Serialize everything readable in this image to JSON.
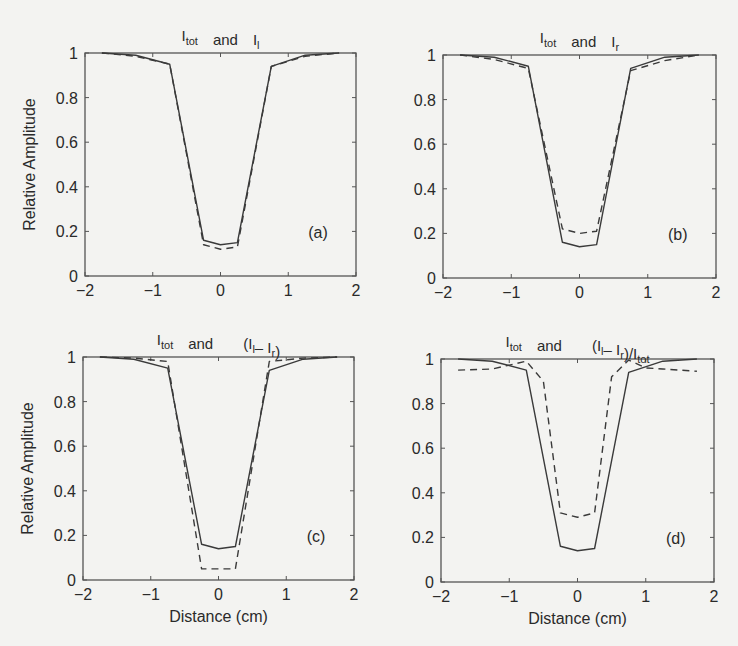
{
  "figure": {
    "background": "#f3f3f1",
    "line_color": "#3a3a3a",
    "axis_color": "#555555"
  },
  "chart_data": [
    {
      "id": "a",
      "type": "line",
      "panel_label": "(a)",
      "title": {
        "parts": [
          {
            "t": "I",
            "sub": "tot"
          },
          {
            "t": "and"
          },
          {
            "t": "I",
            "sub": "l"
          }
        ]
      },
      "title_text": "I_tot and I_l",
      "xlabel": "",
      "ylabel": "Relative Amplitude",
      "xlim": [
        -2,
        2
      ],
      "ylim": [
        0,
        1
      ],
      "xticks": [
        -2,
        -1,
        0,
        1,
        2
      ],
      "yticks": [
        0,
        0.2,
        0.4,
        0.6,
        0.8,
        1
      ],
      "ytick_labels": [
        "0",
        "0.2",
        "0.4",
        "0.6",
        "0.8",
        "1"
      ],
      "grid": false,
      "box": {
        "left": 85,
        "top": 53,
        "right": 356,
        "bottom": 276
      },
      "x": [
        -1.75,
        -1.25,
        -0.75,
        -0.25,
        0,
        0.25,
        0.75,
        1.25,
        1.75
      ],
      "series": [
        {
          "name": "I_tot",
          "style": "solid",
          "values": [
            1.0,
            0.99,
            0.95,
            0.16,
            0.14,
            0.15,
            0.94,
            0.99,
            1.0
          ]
        },
        {
          "name": "I_l",
          "style": "dashed",
          "values": [
            1.0,
            0.985,
            0.95,
            0.14,
            0.12,
            0.13,
            0.94,
            0.985,
            1.0
          ]
        }
      ]
    },
    {
      "id": "b",
      "type": "line",
      "panel_label": "(b)",
      "title": {
        "parts": [
          {
            "t": "I",
            "sub": "tot"
          },
          {
            "t": "and"
          },
          {
            "t": "I",
            "sub": "r"
          }
        ]
      },
      "title_text": "I_tot and I_r",
      "xlabel": "",
      "ylabel": "",
      "xlim": [
        -2,
        2
      ],
      "ylim": [
        0,
        1
      ],
      "xticks": [
        -2,
        -1,
        0,
        1,
        2
      ],
      "yticks": [
        0,
        0.2,
        0.4,
        0.6,
        0.8,
        1
      ],
      "ytick_labels": [
        "0",
        "0.2",
        "0.4",
        "0.6",
        "0.8",
        "1"
      ],
      "grid": false,
      "box": {
        "left": 443,
        "top": 55,
        "right": 716,
        "bottom": 278
      },
      "x": [
        -1.75,
        -1.25,
        -0.75,
        -0.25,
        0,
        0.25,
        0.75,
        1.25,
        1.75
      ],
      "series": [
        {
          "name": "I_tot",
          "style": "solid",
          "values": [
            1.0,
            0.99,
            0.95,
            0.16,
            0.14,
            0.15,
            0.94,
            0.99,
            1.0
          ]
        },
        {
          "name": "I_r",
          "style": "dashed",
          "values": [
            1.0,
            0.98,
            0.94,
            0.22,
            0.2,
            0.21,
            0.93,
            0.975,
            1.0
          ]
        }
      ]
    },
    {
      "id": "c",
      "type": "line",
      "panel_label": "(c)",
      "title": {
        "parts": [
          {
            "t": "I",
            "sub": "tot"
          },
          {
            "t": "and"
          },
          {
            "t": "(I",
            "sub": "l"
          },
          {
            "t": "– I",
            "sub": "r"
          },
          {
            "t": ")"
          }
        ]
      },
      "title_text": "I_tot and (I_l – I_r)",
      "xlabel": "Distance (cm)",
      "ylabel": "Relative Amplitude",
      "xlim": [
        -2,
        2
      ],
      "ylim": [
        0,
        1
      ],
      "xticks": [
        -2,
        -1,
        0,
        1,
        2
      ],
      "yticks": [
        0,
        0.2,
        0.4,
        0.6,
        0.8,
        1
      ],
      "ytick_labels": [
        "0",
        "0.2",
        "0.4",
        "0.6",
        "0.8",
        "1"
      ],
      "grid": false,
      "box": {
        "left": 83,
        "top": 357,
        "right": 354,
        "bottom": 580
      },
      "x": [
        -1.75,
        -1.25,
        -0.75,
        -0.25,
        0,
        0.25,
        0.75,
        1.25,
        1.75
      ],
      "series": [
        {
          "name": "I_tot",
          "style": "solid",
          "values": [
            1.0,
            0.99,
            0.95,
            0.16,
            0.14,
            0.15,
            0.94,
            0.99,
            1.0
          ]
        },
        {
          "name": "I_l - I_r",
          "style": "dashed",
          "values": [
            1.0,
            0.995,
            0.98,
            0.05,
            0.05,
            0.05,
            0.98,
            0.995,
            1.0
          ]
        }
      ]
    },
    {
      "id": "d",
      "type": "line",
      "panel_label": "(d)",
      "title": {
        "parts": [
          {
            "t": "I",
            "sub": "tot"
          },
          {
            "t": "and"
          },
          {
            "t": "(I",
            "sub": "l"
          },
          {
            "t": "– I",
            "sub": "r"
          },
          {
            "t": ")/I",
            "sub": "tot"
          }
        ]
      },
      "title_text": "I_tot and (I_l – I_r)/I_tot",
      "xlabel": "Distance (cm)",
      "ylabel": "",
      "xlim": [
        -2,
        2
      ],
      "ylim": [
        0,
        1
      ],
      "xticks": [
        -2,
        -1,
        0,
        1,
        2
      ],
      "yticks": [
        0,
        0.2,
        0.4,
        0.6,
        0.8,
        1
      ],
      "ytick_labels": [
        "0",
        "0.2",
        "0.4",
        "0.6",
        "0.8",
        "1"
      ],
      "grid": false,
      "box": {
        "left": 441,
        "top": 359,
        "right": 714,
        "bottom": 582
      },
      "x": [
        -1.75,
        -1.25,
        -0.75,
        -0.5,
        -0.25,
        0,
        0.25,
        0.5,
        0.75,
        1.0,
        1.25,
        1.75
      ],
      "series": [
        {
          "name": "I_tot",
          "style": "solid",
          "x": [
            -1.75,
            -1.25,
            -0.75,
            -0.25,
            0,
            0.25,
            0.75,
            1.25,
            1.75
          ],
          "values": [
            1.0,
            0.99,
            0.95,
            0.16,
            0.14,
            0.15,
            0.94,
            0.99,
            1.0
          ]
        },
        {
          "name": "(I_l - I_r)/I_tot",
          "style": "dashed",
          "x": [
            -1.75,
            -1.25,
            -0.75,
            -0.5,
            -0.25,
            0,
            0.25,
            0.5,
            0.75,
            1.0,
            1.25,
            1.75
          ],
          "values": [
            0.95,
            0.955,
            0.99,
            0.9,
            0.31,
            0.29,
            0.31,
            0.92,
            0.995,
            0.96,
            0.955,
            0.945
          ]
        }
      ]
    }
  ]
}
